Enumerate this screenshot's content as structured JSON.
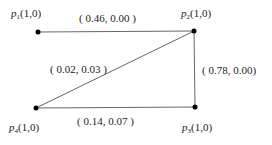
{
  "diagram": {
    "type": "graph",
    "nodes": [
      {
        "id": "p1",
        "name": "p",
        "sub": "1",
        "args": "(1,0)",
        "x": 38,
        "y": 32
      },
      {
        "id": "p2",
        "name": "p",
        "sub": "2",
        "args": "(1,0)",
        "x": 194,
        "y": 31
      },
      {
        "id": "p3",
        "name": "p",
        "sub": "3",
        "args": "(1,0)",
        "x": 195,
        "y": 107
      },
      {
        "id": "p4",
        "name": "p",
        "sub": "4",
        "args": "(1,0)",
        "x": 36,
        "y": 108
      }
    ],
    "edges": [
      {
        "from": "p1",
        "to": "p2",
        "label": "( 0.46, 0.00 )"
      },
      {
        "from": "p2",
        "to": "p3",
        "label": "( 0.78, 0.00)"
      },
      {
        "from": "p4",
        "to": "p3",
        "label": "( 0.14, 0.07 )"
      },
      {
        "from": "p4",
        "to": "p2",
        "label": "( 0.02, 0.03 )"
      }
    ],
    "colors": {
      "node": "#000000",
      "edge": "#555555",
      "text": "#222222"
    }
  }
}
